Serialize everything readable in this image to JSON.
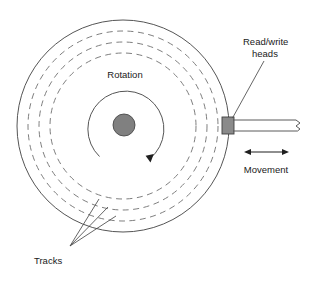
{
  "figure": {
    "background_color": "#ffffff"
  },
  "labels": {
    "rotation": "Rotation",
    "read_write_heads_line1": "Read/write",
    "read_write_heads_line2": "heads",
    "movement": "Movement",
    "tracks": "Tracks"
  },
  "colors": {
    "outline": "#555555",
    "track": "#777777",
    "hub_fill": "#808080",
    "head_fill": "#8a8a8a",
    "text": "#1a1a1a",
    "arrow": "#1f1f1f"
  },
  "geometry": {
    "platter": {
      "cx": 123,
      "cy": 126,
      "r": 106
    },
    "tracks": [
      {
        "cx": 123,
        "cy": 126,
        "r": 95
      },
      {
        "cx": 123,
        "cy": 126,
        "r": 84
      },
      {
        "cx": 123,
        "cy": 126,
        "r": 73
      }
    ],
    "rotation_arc": {
      "cx": 124,
      "cy": 126,
      "r": 38
    },
    "hub": {
      "cx": 124,
      "cy": 125,
      "r": 11
    },
    "head": {
      "x": 222,
      "y": 117,
      "w": 12,
      "h": 17
    },
    "arm": {
      "x1": 233,
      "x2": 305,
      "y_top": 120,
      "y_bottom": 131
    },
    "movement_arrow": {
      "x1": 245,
      "x2": 288,
      "y": 152
    }
  }
}
